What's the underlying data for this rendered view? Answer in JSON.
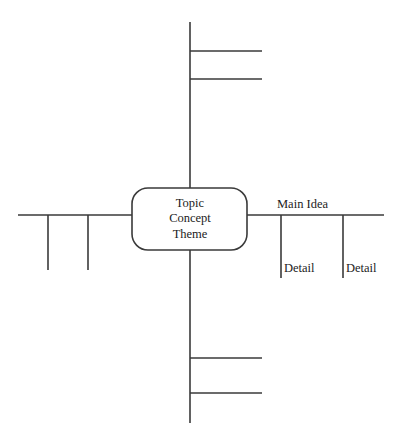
{
  "diagram": {
    "type": "concept-map",
    "stroke_color": "#3a3a3a",
    "text_color": "#1c1c1c",
    "background_color": "#ffffff",
    "center_node": {
      "lines": [
        "Topic",
        "Concept",
        "Theme"
      ],
      "line1": "Topic",
      "line2": "Concept",
      "line3": "Theme",
      "shape": "rounded-rectangle"
    },
    "branches": {
      "right": {
        "main_label": "Main Idea",
        "details": [
          "Detail",
          "Detail"
        ],
        "detail1": "Detail",
        "detail2": "Detail"
      },
      "left": {
        "main_label": "",
        "details": [
          "",
          ""
        ]
      },
      "top": {
        "main_label": "",
        "details": [
          "",
          ""
        ]
      },
      "bottom": {
        "main_label": "",
        "details": [
          "",
          ""
        ]
      }
    }
  }
}
